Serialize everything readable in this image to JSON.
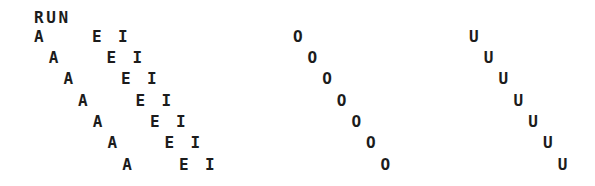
{
  "title": "RUN",
  "text_color": "#1c1c1c",
  "background": "#ffffff",
  "groups": {
    "a_column": {
      "letter": "A",
      "count": 7,
      "start_x": 34,
      "step_x": 14.7
    },
    "e_column": {
      "letter": "E",
      "count": 7,
      "start_x": 92,
      "step_x": 14.5
    },
    "i_column": {
      "letter": "I",
      "count": 7,
      "start_x": 118,
      "step_x": 14.5
    },
    "o_column": {
      "letter": "O",
      "count": 7,
      "start_x": 293,
      "step_x": 14.6
    },
    "u_column": {
      "letter": "U",
      "count": 7,
      "start_x": 469,
      "step_x": 14.8
    }
  },
  "row_tops": [
    29,
    50,
    71,
    93,
    114,
    135,
    157
  ]
}
